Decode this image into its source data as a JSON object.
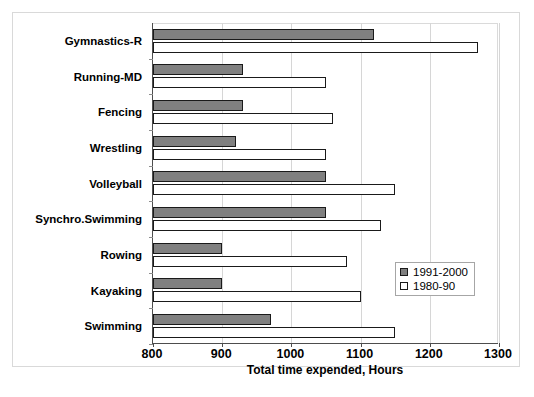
{
  "chart_data": {
    "type": "bar",
    "orientation": "horizontal",
    "title": "",
    "xlabel": "Total time expended, Hours",
    "ylabel": "",
    "xlim": [
      800,
      1300
    ],
    "xticks": [
      800,
      900,
      1000,
      1100,
      1200,
      1300
    ],
    "grid": true,
    "legend_position": "inside-right-lower",
    "categories": [
      "Gymnastics-R",
      "Running-MD",
      "Fencing",
      "Wrestling",
      "Volleyball",
      "Synchro.Swimming",
      "Rowing",
      "Kayaking",
      "Swimming"
    ],
    "series": [
      {
        "name": "1991-2000",
        "color": "#808080",
        "values": [
          1120,
          930,
          930,
          920,
          1050,
          1050,
          900,
          900,
          970
        ]
      },
      {
        "name": "1980-90",
        "color": "#ffffff",
        "values": [
          1270,
          1050,
          1060,
          1050,
          1150,
          1130,
          1080,
          1100,
          1150
        ]
      }
    ]
  },
  "legend": {
    "entries": [
      {
        "label": "1991-2000"
      },
      {
        "label": "1980-90"
      }
    ]
  }
}
